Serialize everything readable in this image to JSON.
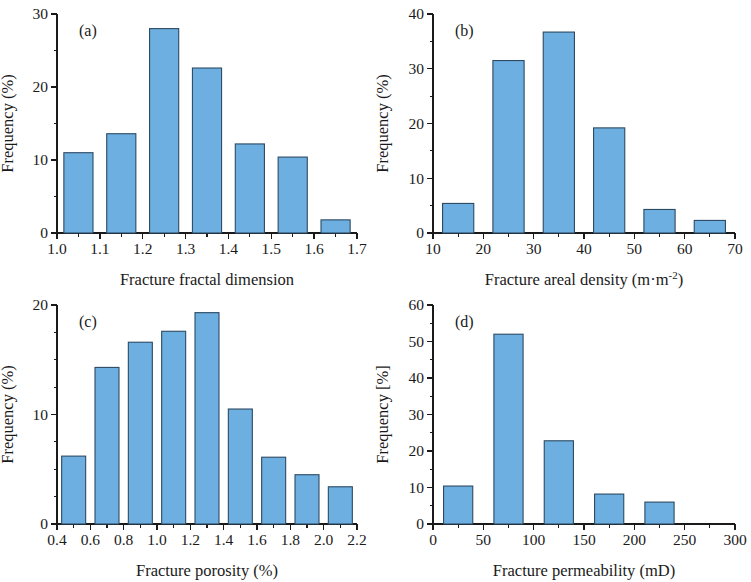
{
  "figure": {
    "background_color": "#ffffff",
    "bar_fill_color": "#6CAFE0",
    "bar_edge_color": "#2d4a63",
    "axis_color": "#1a1a1a"
  },
  "chart_data": [
    {
      "id": "panel-a",
      "type": "bar",
      "title": "",
      "tag": "(a)",
      "xlabel": "Fracture fractal dimension",
      "ylabel": "Frequency (%)",
      "xlim": [
        1.0,
        1.7
      ],
      "ylim": [
        0,
        30
      ],
      "xticks": [
        1.0,
        1.1,
        1.2,
        1.3,
        1.4,
        1.5,
        1.6,
        1.7
      ],
      "xtick_labels": [
        "1.0",
        "1.1",
        "1.2",
        "1.3",
        "1.4",
        "1.5",
        "1.6",
        "1.7"
      ],
      "yticks": [
        0,
        10,
        20,
        30
      ],
      "ytick_labels": [
        "0",
        "10",
        "20",
        "30"
      ],
      "x_minor_step": 0.05,
      "y_minor_step": 5,
      "bin_edges": [
        1.0,
        1.1,
        1.2,
        1.3,
        1.4,
        1.5,
        1.6,
        1.7
      ],
      "categories": [
        "1.0-1.1",
        "1.1-1.2",
        "1.2-1.3",
        "1.3-1.4",
        "1.4-1.5",
        "1.5-1.6",
        "1.6-1.7"
      ],
      "values": [
        11.0,
        13.6,
        28.0,
        22.6,
        12.2,
        10.4,
        1.8
      ],
      "bar_width_fraction": 0.68,
      "grid": false,
      "legend": "none"
    },
    {
      "id": "panel-b",
      "type": "bar",
      "title": "",
      "tag": "(b)",
      "xlabel": "Fracture areal density (m·m",
      "xlabel_sup": "-2",
      "xlabel_tail": ")",
      "ylabel": "Frequency (%)",
      "xlim": [
        10,
        70
      ],
      "ylim": [
        0,
        40
      ],
      "xticks": [
        10,
        20,
        30,
        40,
        50,
        60,
        70
      ],
      "xtick_labels": [
        "10",
        "20",
        "30",
        "40",
        "50",
        "60",
        "70"
      ],
      "yticks": [
        0,
        10,
        20,
        30,
        40
      ],
      "ytick_labels": [
        "0",
        "10",
        "20",
        "30",
        "40"
      ],
      "x_minor_step": 5,
      "y_minor_step": 5,
      "bin_edges": [
        10,
        20,
        30,
        40,
        50,
        60,
        70
      ],
      "categories": [
        "10-20",
        "20-30",
        "30-40",
        "40-50",
        "50-60",
        "60-70"
      ],
      "values": [
        5.4,
        31.5,
        36.7,
        19.2,
        4.3,
        2.3
      ],
      "bar_width_fraction": 0.62,
      "grid": false,
      "legend": "none"
    },
    {
      "id": "panel-c",
      "type": "bar",
      "title": "",
      "tag": "(c)",
      "xlabel": "Fracture porosity (%)",
      "ylabel": "Frequency (%)",
      "xlim": [
        0.4,
        2.2
      ],
      "ylim": [
        0,
        20
      ],
      "xticks": [
        0.4,
        0.6,
        0.8,
        1.0,
        1.2,
        1.4,
        1.6,
        1.8,
        2.0,
        2.2
      ],
      "xtick_labels": [
        "0.4",
        "0.6",
        "0.8",
        "1.0",
        "1.2",
        "1.4",
        "1.6",
        "1.8",
        "2.0",
        "2.2"
      ],
      "yticks": [
        0,
        10,
        20
      ],
      "ytick_labels": [
        "0",
        "10",
        "20"
      ],
      "x_minor_step": 0.1,
      "y_minor_step": 2.5,
      "bin_edges": [
        0.4,
        0.6,
        0.8,
        1.0,
        1.2,
        1.4,
        1.6,
        1.8,
        2.0,
        2.2
      ],
      "categories": [
        "0.4-0.6",
        "0.6-0.8",
        "0.8-1.0",
        "1.0-1.2",
        "1.2-1.4",
        "1.4-1.6",
        "1.6-1.8",
        "1.8-2.0",
        "2.0-2.2"
      ],
      "values": [
        6.2,
        14.3,
        16.6,
        17.6,
        19.3,
        10.5,
        6.1,
        4.5,
        3.4
      ],
      "bar_width_fraction": 0.72,
      "grid": false,
      "legend": "none"
    },
    {
      "id": "panel-d",
      "type": "bar",
      "title": "",
      "tag": "(d)",
      "xlabel": "Fracture permeability (mD)",
      "ylabel": "Frequency [%]",
      "xlim": [
        0,
        300
      ],
      "ylim": [
        0,
        60
      ],
      "xticks": [
        0,
        50,
        100,
        150,
        200,
        250,
        300
      ],
      "xtick_labels": [
        "0",
        "50",
        "100",
        "150",
        "200",
        "250",
        "300"
      ],
      "yticks": [
        0,
        10,
        20,
        30,
        40,
        50,
        60
      ],
      "ytick_labels": [
        "0",
        "10",
        "20",
        "30",
        "40",
        "50",
        "60"
      ],
      "x_minor_step": 25,
      "y_minor_step": 5,
      "bin_edges": [
        0,
        50,
        100,
        150,
        200,
        250
      ],
      "categories": [
        "0-50",
        "50-100",
        "100-150",
        "150-200",
        "200-250"
      ],
      "values": [
        10.4,
        52.0,
        22.8,
        8.2,
        6.0
      ],
      "bar_width_fraction": 0.58,
      "grid": false,
      "legend": "none"
    }
  ]
}
